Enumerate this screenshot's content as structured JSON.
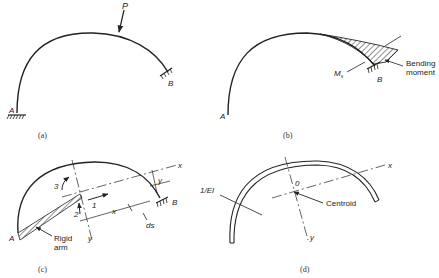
{
  "figure": {
    "panels": [
      {
        "id": "a",
        "caption": "(a)",
        "labels": {
          "load": "P",
          "support_left": "A",
          "support_right": "B"
        }
      },
      {
        "id": "b",
        "caption": "(b)",
        "labels": {
          "support_left": "A",
          "support_right": "B",
          "moment_symbol": "M",
          "moment_subscript": "s",
          "annotation_line1": "Bending",
          "annotation_line2": "moment"
        }
      },
      {
        "id": "c",
        "caption": "(c)",
        "labels": {
          "support_left": "A",
          "support_right": "B",
          "axis_x": "x",
          "axis_y": "y",
          "dim_x": "x",
          "dim_y": "y",
          "element": "ds",
          "dof_1": "1",
          "dof_2": "2",
          "dof_3": "3",
          "arm_line1": "Rigid",
          "arm_line2": "arm"
        }
      },
      {
        "id": "d",
        "caption": "(d)",
        "labels": {
          "width_label": "1/EI",
          "origin": "0",
          "axis_x": "x",
          "axis_y": "y",
          "centroid": "Centroid"
        }
      }
    ]
  }
}
